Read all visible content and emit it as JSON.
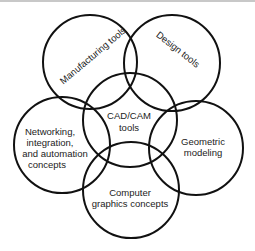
{
  "diagram": {
    "type": "venn-flower",
    "center": {
      "label_line1": "CAD/CAM",
      "label_line2": "tools"
    },
    "petals": [
      {
        "id": "manufacturing",
        "label": "Manufacturing tools"
      },
      {
        "id": "design",
        "label": "Design tools"
      },
      {
        "id": "networking",
        "lines": [
          "Networking,",
          "integration,",
          "and automation",
          "concepts"
        ]
      },
      {
        "id": "geometric",
        "lines": [
          "Geometric",
          "modeling"
        ]
      },
      {
        "id": "graphics",
        "lines": [
          "Computer",
          "graphics concepts"
        ]
      }
    ]
  }
}
